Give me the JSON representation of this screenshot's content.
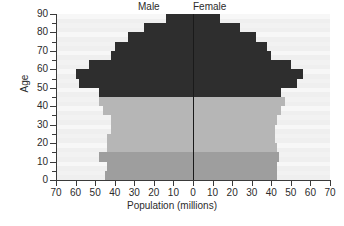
{
  "chart_data": {
    "type": "bar",
    "title": "",
    "subtitle": "",
    "xlabel": "Population (millions)",
    "ylabel": "Age",
    "male_label": "Male",
    "female_label": "Female",
    "orientation": "population-pyramid",
    "grid": false,
    "legend_position": "top",
    "xlim": [
      -70,
      70
    ],
    "ylim": [
      0,
      90
    ],
    "x_tick_labels": [
      "70",
      "60",
      "50",
      "40",
      "30",
      "20",
      "10",
      "0",
      "10",
      "20",
      "30",
      "40",
      "50",
      "60",
      "70"
    ],
    "x_tick_values": [
      -70,
      -60,
      -50,
      -40,
      -30,
      -20,
      -10,
      0,
      10,
      20,
      30,
      40,
      50,
      60,
      70
    ],
    "y_tick_labels": [
      "0",
      "10",
      "20",
      "30",
      "40",
      "50",
      "60",
      "70",
      "80",
      "90"
    ],
    "y_tick_values": [
      0,
      10,
      20,
      30,
      40,
      50,
      60,
      70,
      80,
      90
    ],
    "y_minor_tick_values": [
      5,
      15,
      25,
      35,
      45,
      55,
      65,
      75,
      85
    ],
    "age_band_width": 5,
    "categories": [
      "0-4",
      "5-9",
      "10-14",
      "15-19",
      "20-24",
      "25-29",
      "30-34",
      "35-39",
      "40-44",
      "45-49",
      "50-54",
      "55-59",
      "60-64",
      "65-69",
      "70-74",
      "75-79",
      "80-84",
      "85-89"
    ],
    "series": [
      {
        "name": "Male",
        "side": "left",
        "values": [
          45,
          44,
          48,
          44,
          44,
          42,
          42,
          46,
          48,
          48,
          58,
          60,
          53,
          42,
          40,
          33,
          25,
          14
        ]
      },
      {
        "name": "Female",
        "side": "right",
        "values": [
          43,
          43,
          44,
          43,
          42,
          42,
          43,
          45,
          47,
          45,
          53,
          56,
          50,
          40,
          38,
          32,
          24,
          14
        ]
      }
    ],
    "band_colors": [
      "#9e9e9e",
      "#9e9e9e",
      "#9e9e9e",
      "#b6b6b6",
      "#b6b6b6",
      "#b6b6b6",
      "#b6b6b6",
      "#b6b6b6",
      "#b6b6b6",
      "#2e2e2e",
      "#2e2e2e",
      "#2e2e2e",
      "#2e2e2e",
      "#2e2e2e",
      "#2e2e2e",
      "#2e2e2e",
      "#2e2e2e",
      "#2e2e2e"
    ],
    "colors": {
      "dark_band": "#2e2e2e",
      "mid_band": "#9e9e9e",
      "light_band": "#b6b6b6",
      "plot_background": "#efefef",
      "axis": "#3a3a3a",
      "text": "#2b2b2b"
    }
  },
  "caption": ""
}
